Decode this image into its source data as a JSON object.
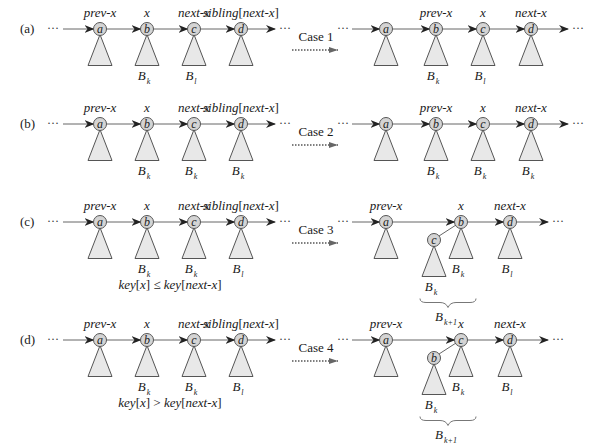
{
  "figure": {
    "ellipsis": "···",
    "rows": [
      {
        "id": "a",
        "label": "(a)",
        "case_label": "Case 1",
        "before": {
          "pointers": [
            "prev-x",
            "x",
            "next-x",
            "sibling[next-x]"
          ],
          "nodes": [
            "a",
            "b",
            "c",
            "d"
          ],
          "subtrees": [
            "",
            "B",
            "B",
            ""
          ],
          "subscripts": [
            "",
            "k",
            "l",
            ""
          ],
          "condition": ""
        },
        "after": {
          "pointers": [
            "",
            "prev-x",
            "x",
            "next-x"
          ],
          "nodes": [
            "a",
            "b",
            "c",
            "d"
          ],
          "subtrees": [
            "",
            "B",
            "B",
            ""
          ],
          "subscripts": [
            "",
            "k",
            "l",
            ""
          ]
        }
      },
      {
        "id": "b",
        "label": "(b)",
        "case_label": "Case 2",
        "before": {
          "pointers": [
            "prev-x",
            "x",
            "next-x",
            "sibling[next-x]"
          ],
          "nodes": [
            "a",
            "b",
            "c",
            "d"
          ],
          "subtrees": [
            "",
            "B",
            "B",
            "B"
          ],
          "subscripts": [
            "",
            "k",
            "k",
            "k"
          ],
          "condition": ""
        },
        "after": {
          "pointers": [
            "",
            "prev-x",
            "x",
            "next-x"
          ],
          "nodes": [
            "a",
            "b",
            "c",
            "d"
          ],
          "subtrees": [
            "",
            "B",
            "B",
            "B"
          ],
          "subscripts": [
            "",
            "k",
            "k",
            "k"
          ]
        }
      },
      {
        "id": "c",
        "label": "(c)",
        "case_label": "Case 3",
        "before": {
          "pointers": [
            "prev-x",
            "x",
            "next-x",
            "sibling[next-x]"
          ],
          "nodes": [
            "a",
            "b",
            "c",
            "d"
          ],
          "subtrees": [
            "",
            "B",
            "B",
            "B"
          ],
          "subscripts": [
            "",
            "k",
            "k",
            "l"
          ],
          "condition": "key[x] ≤ key[next-x]"
        },
        "after": {
          "pointers": [
            "prev-x",
            "x",
            "next-x"
          ],
          "root": "b",
          "child": "c",
          "nodes": [
            "a",
            "b",
            "d"
          ],
          "child_subtree": "B",
          "child_subscript": "k",
          "root_subtree": "B",
          "root_subscript": "k",
          "next_subtree": "B",
          "next_subscript": "l",
          "merged_subtree": "B",
          "merged_subscript": "k+1"
        }
      },
      {
        "id": "d",
        "label": "(d)",
        "case_label": "Case 4",
        "before": {
          "pointers": [
            "prev-x",
            "x",
            "next-x",
            "sibling[next-x]"
          ],
          "nodes": [
            "a",
            "b",
            "c",
            "d"
          ],
          "subtrees": [
            "",
            "B",
            "B",
            "B"
          ],
          "subscripts": [
            "",
            "k",
            "k",
            "l"
          ],
          "condition": "key[x] > key[next-x]"
        },
        "after": {
          "pointers": [
            "prev-x",
            "x",
            "next-x"
          ],
          "root": "c",
          "child": "b",
          "nodes": [
            "a",
            "c",
            "d"
          ],
          "child_subtree": "B",
          "child_subscript": "k",
          "root_subtree": "B",
          "root_subscript": "k",
          "next_subtree": "B",
          "next_subscript": "l",
          "merged_subtree": "B",
          "merged_subscript": "k+1"
        }
      }
    ]
  }
}
